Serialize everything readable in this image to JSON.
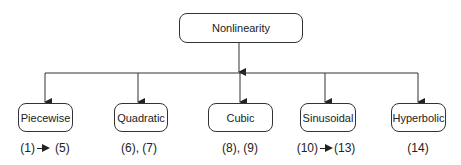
{
  "root": {
    "label": "Nonlinearity"
  },
  "children": [
    {
      "label": "Piecewise",
      "eq_from": "(1)",
      "eq_to": "(5)",
      "range": true
    },
    {
      "label": "Quadratic",
      "eq_text": "(6), (7)",
      "range": false
    },
    {
      "label": "Cubic",
      "eq_text": "(8), (9)",
      "range": false
    },
    {
      "label": "Sinusoidal",
      "eq_from": "(10)",
      "eq_to": "(13)",
      "range": true
    },
    {
      "label": "Hyperbolic",
      "eq_text": "(14)",
      "range": false
    }
  ]
}
